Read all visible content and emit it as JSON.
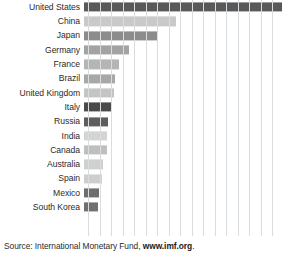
{
  "source": {
    "prefix": "Source: International Monetary Fund, ",
    "link": "www.imf.org",
    "suffix": "."
  },
  "chart_data": {
    "type": "bar",
    "orientation": "horizontal",
    "title": "",
    "xlabel": "",
    "ylabel": "",
    "grid": true,
    "gridlines": 16,
    "legend": "none",
    "xlim": [
      0,
      16
    ],
    "categories": [
      "United States",
      "China",
      "Japan",
      "Germany",
      "France",
      "Brazil",
      "United Kingdom",
      "Italy",
      "Russia",
      "India",
      "Canada",
      "Australia",
      "Spain",
      "Mexico",
      "South Korea"
    ],
    "values": [
      15.7,
      7.3,
      5.9,
      3.6,
      2.8,
      2.5,
      2.4,
      2.2,
      1.9,
      1.8,
      1.8,
      1.5,
      1.4,
      1.2,
      1.1
    ],
    "bars": [
      {
        "label": "United States",
        "value": 15.7,
        "length_pct": 100.0,
        "color": "#595959"
      },
      {
        "label": "China",
        "value": 7.3,
        "length_pct": 46.5,
        "color": "#c9c9c9"
      },
      {
        "label": "Japan",
        "value": 5.9,
        "length_pct": 37.6,
        "color": "#8c8c8c"
      },
      {
        "label": "Germany",
        "value": 3.6,
        "length_pct": 22.9,
        "color": "#a3a3a3"
      },
      {
        "label": "France",
        "value": 2.8,
        "length_pct": 17.8,
        "color": "#b5b5b5"
      },
      {
        "label": "Brazil",
        "value": 2.5,
        "length_pct": 15.9,
        "color": "#a8a8a8"
      },
      {
        "label": "United Kingdom",
        "value": 2.4,
        "length_pct": 15.3,
        "color": "#c4c4c4"
      },
      {
        "label": "Italy",
        "value": 2.2,
        "length_pct": 14.0,
        "color": "#4a4a4a"
      },
      {
        "label": "Russia",
        "value": 1.9,
        "length_pct": 12.1,
        "color": "#5e5e5e"
      },
      {
        "label": "India",
        "value": 1.8,
        "length_pct": 11.5,
        "color": "#d4d4d4"
      },
      {
        "label": "Canada",
        "value": 1.8,
        "length_pct": 11.5,
        "color": "#bfbfbf"
      },
      {
        "label": "Australia",
        "value": 1.5,
        "length_pct": 9.6,
        "color": "#d0d0d0"
      },
      {
        "label": "Spain",
        "value": 1.4,
        "length_pct": 8.9,
        "color": "#cecece"
      },
      {
        "label": "Mexico",
        "value": 1.2,
        "length_pct": 7.6,
        "color": "#6e6e6e"
      },
      {
        "label": "South Korea",
        "value": 1.1,
        "length_pct": 7.0,
        "color": "#707070"
      }
    ]
  }
}
